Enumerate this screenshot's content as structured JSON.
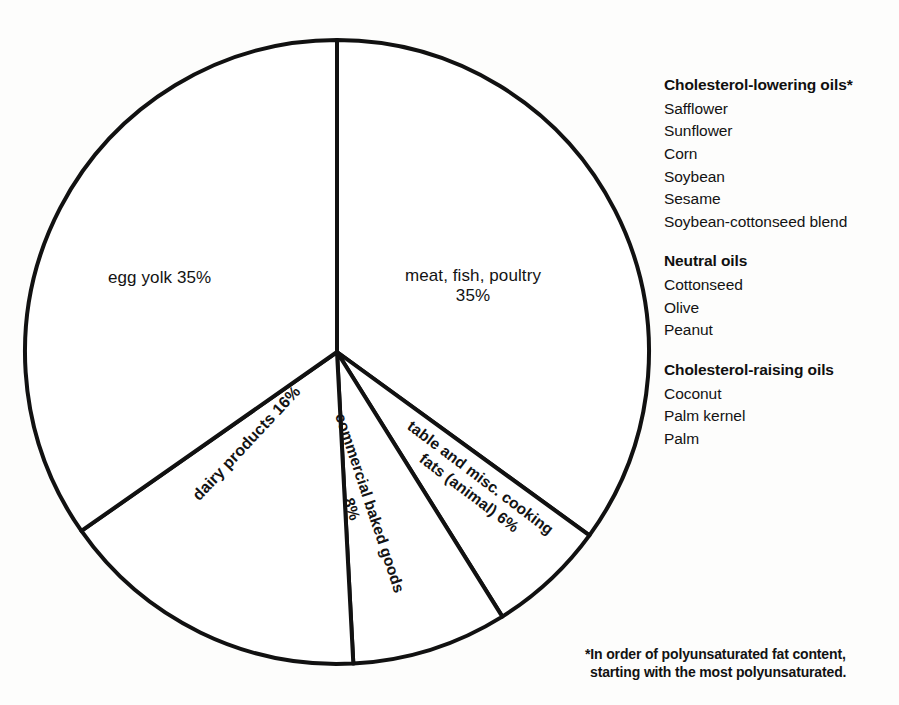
{
  "chart_data": {
    "type": "pie",
    "title": "",
    "subtitle": "",
    "xlabel": "",
    "ylabel": "",
    "legend_position": "right",
    "grid": false,
    "unit": "%",
    "start_angle_deg": 0,
    "direction": "clockwise",
    "categories": [
      "meat, fish, poultry",
      "table and misc. cooking fats (animal)",
      "commercial baked goods",
      "dairy products",
      "egg yolk"
    ],
    "values": [
      35,
      6,
      8,
      16,
      35
    ],
    "slices": [
      {
        "name": "meat-fish-poultry",
        "label_line_1": "meat, fish, poultry",
        "label_line_2": "35%",
        "value": 35,
        "percent_text": "35%",
        "start_deg": 0,
        "end_deg": 126,
        "rotation_deg": 0
      },
      {
        "name": "table-and-misc-cooking-fats-animal",
        "label_line_1": "table and misc. cooking",
        "label_line_2": "fats (animal) 6%",
        "value": 6,
        "percent_text": "6%",
        "start_deg": 126,
        "end_deg": 148,
        "rotation_deg": 37
      },
      {
        "name": "commercial-baked-goods",
        "label_line_1": "commercial baked goods",
        "label_line_2": "8%",
        "value": 8,
        "percent_text": "8%",
        "start_deg": 148,
        "end_deg": 177,
        "rotation_deg": 71.5
      },
      {
        "name": "dairy-products",
        "label_line_1": "dairy products 16%",
        "label_line_2": "",
        "value": 16,
        "percent_text": "16%",
        "start_deg": 177,
        "end_deg": 235,
        "rotation_deg": -47
      },
      {
        "name": "egg-yolk",
        "label_line_1": "egg yolk 35%",
        "label_line_2": "",
        "value": 35,
        "percent_text": "35%",
        "start_deg": 235,
        "end_deg": 360,
        "rotation_deg": 0
      }
    ],
    "style": {
      "fill": "#ffffff",
      "stroke": "#111111",
      "stroke_width": 4,
      "background": "#fdfdfc"
    },
    "geometry": {
      "center_x": 337,
      "center_y": 352,
      "radius": 312
    }
  },
  "legend": {
    "groups": [
      {
        "heading": "Cholesterol-lowering oils*",
        "items": [
          "Safflower",
          "Sunflower",
          "Corn",
          "Soybean",
          "Sesame",
          "Soybean-cottonseed blend"
        ]
      },
      {
        "heading": "Neutral oils",
        "items": [
          "Cottonseed",
          "Olive",
          "Peanut"
        ]
      },
      {
        "heading": "Cholesterol-raising oils",
        "items": [
          "Coconut",
          "Palm kernel",
          "Palm"
        ]
      }
    ]
  },
  "footnote": {
    "line_1": "*In order of polyunsaturated fat content,",
    "line_2": "starting with the most polyunsaturated."
  }
}
